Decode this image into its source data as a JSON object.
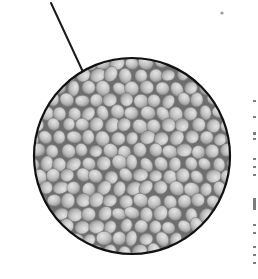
{
  "figure": {
    "background": "#ffffff",
    "leader_line": {
      "x1": 51,
      "y1": 3,
      "x2": 83,
      "y2": 72,
      "color": "#1a1a1a",
      "width": 2
    },
    "magnified_view": {
      "cx": 132,
      "cy": 156,
      "r": 98,
      "border_color": "#111111",
      "border_width": 2.2,
      "gap_color": "#6e6e6e",
      "grain_fill": "#c4c4c4",
      "grain_highlight": "#e2e2e2",
      "grain_shadow": "#8f8f8f",
      "grain_size_px": [
        12,
        16
      ],
      "content": "densely packed rounded grains (seeds / pellets)"
    },
    "speck": {
      "x": 222,
      "y": 13,
      "r": 1.6,
      "color": "#9a9a9a"
    },
    "edge_marks": [
      {
        "y": 4,
        "h": 2
      },
      {
        "y": 20,
        "h": 2
      },
      {
        "y": 36,
        "h": 3
      },
      {
        "y": 42,
        "h": 2
      },
      {
        "y": 62,
        "h": 2
      },
      {
        "y": 70,
        "h": 2
      },
      {
        "y": 78,
        "h": 2
      },
      {
        "y": 102,
        "h": 12
      },
      {
        "y": 128,
        "h": 2
      },
      {
        "y": 136,
        "h": 2
      },
      {
        "y": 150,
        "h": 2
      },
      {
        "y": 158,
        "h": 2
      },
      {
        "y": 166,
        "h": 2
      }
    ]
  }
}
